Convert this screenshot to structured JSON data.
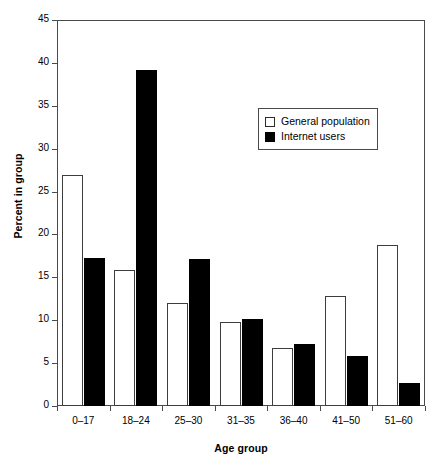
{
  "chart_data": {
    "type": "bar",
    "title": "",
    "xlabel": "Age group",
    "ylabel": "Percent in group",
    "categories": [
      "0–17",
      "18–24",
      "25–30",
      "31–35",
      "36–40",
      "41–50",
      "51–60"
    ],
    "series": [
      {
        "name": "General population",
        "style": "open",
        "color": "#ffffff",
        "edge_color": "#000000",
        "values": [
          26.9,
          15.9,
          12.0,
          9.8,
          6.8,
          12.8,
          18.8
        ]
      },
      {
        "name": "Internet users",
        "style": "filled",
        "color": "#000000",
        "edge_color": "#000000",
        "values": [
          17.2,
          39.2,
          17.1,
          10.2,
          7.2,
          5.8,
          2.7
        ]
      }
    ],
    "ylim": [
      0,
      45
    ],
    "yticks": [
      0,
      5,
      10,
      15,
      20,
      25,
      30,
      35,
      40,
      45
    ],
    "ytick_labels": [
      "0",
      "5",
      "10",
      "15",
      "20",
      "25",
      "30",
      "35",
      "40",
      "45"
    ],
    "grid": false,
    "legend_position": "upper right",
    "axis_color": "#4a4a4a"
  }
}
